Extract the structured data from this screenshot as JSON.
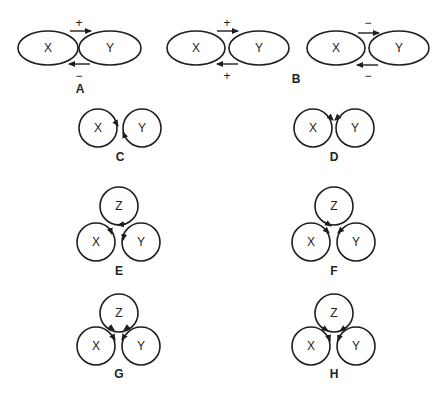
{
  "figure": {
    "background": "#ffffff",
    "stroke_color": "#1e1e1e",
    "panels": [
      {
        "id": "A",
        "label": "A",
        "type": "ellipse-pair",
        "nodes": [
          "X",
          "Y"
        ],
        "edges": [
          {
            "from": "X",
            "to": "Y",
            "sign": "+",
            "position": "top"
          },
          {
            "from": "Y",
            "to": "X",
            "sign": "-",
            "position": "bottom"
          }
        ]
      },
      {
        "id": "B",
        "label": "B",
        "type": "ellipse-pair",
        "nodes": [
          "X",
          "Y"
        ],
        "edges": [
          {
            "from": "X",
            "to": "Y",
            "sign": "+",
            "position": "top"
          },
          {
            "from": "Y",
            "to": "X",
            "sign": "+",
            "position": "bottom"
          }
        ]
      },
      {
        "id": "B2",
        "label": "",
        "type": "ellipse-pair",
        "nodes": [
          "X",
          "Y"
        ],
        "edges": [
          {
            "from": "X",
            "to": "Y",
            "sign": "-",
            "position": "top"
          },
          {
            "from": "Y",
            "to": "X",
            "sign": "-",
            "position": "bottom"
          }
        ]
      },
      {
        "id": "C",
        "label": "C",
        "type": "circle-pair",
        "nodes": [
          "X",
          "Y"
        ],
        "arrow_style": "rotating-opposite"
      },
      {
        "id": "D",
        "label": "D",
        "type": "circle-pair",
        "nodes": [
          "X",
          "Y"
        ],
        "arrow_style": "converging-top"
      },
      {
        "id": "E",
        "label": "E",
        "type": "circle-triad",
        "nodes": [
          "Z",
          "X",
          "Y"
        ],
        "arrow_style": "cyclic"
      },
      {
        "id": "F",
        "label": "F",
        "type": "circle-triad",
        "nodes": [
          "Z",
          "X",
          "Y"
        ],
        "arrow_style": "converging"
      },
      {
        "id": "G",
        "label": "G",
        "type": "circle-triad",
        "nodes": [
          "Z",
          "X",
          "Y"
        ],
        "arrow_style": "mutual-center"
      },
      {
        "id": "H",
        "label": "H",
        "type": "circle-triad",
        "nodes": [
          "Z",
          "X",
          "Y"
        ],
        "arrow_style": "all-inward"
      }
    ]
  },
  "text": {
    "A": "A",
    "B": "B",
    "C": "C",
    "D": "D",
    "E": "E",
    "F": "F",
    "G": "G",
    "H": "H",
    "X": "X",
    "Y": "Y",
    "Z": "Z",
    "signA_top": "+",
    "signA_bottom": "−",
    "signB_top": "+",
    "signB_bottom": "+",
    "signB2_top": "−",
    "signB2_bottom": "−"
  }
}
